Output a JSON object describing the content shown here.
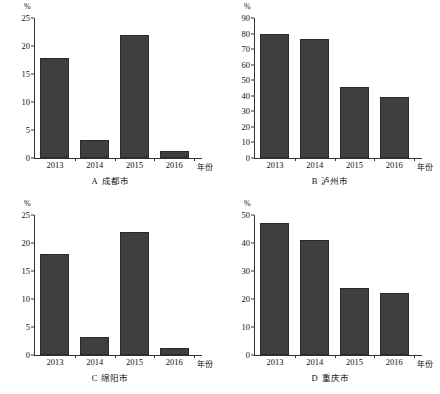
{
  "figure": {
    "y_unit": "%",
    "x_axis_name": "年份",
    "categories": [
      "2013",
      "2014",
      "2015",
      "2016"
    ],
    "bar_color": "#3f3f3f"
  },
  "panels": [
    {
      "letter": "A",
      "city": "成都市",
      "caption": "A 成都市",
      "y_unit": "%",
      "x_axis_name": "年份",
      "yticks": [
        "0",
        "5",
        "10",
        "15",
        "20",
        "25"
      ],
      "ymax": 25,
      "values": [
        17.8,
        3.2,
        22.0,
        1.3
      ],
      "categories": [
        "2013",
        "2014",
        "2015",
        "2016"
      ]
    },
    {
      "letter": "B",
      "city": "泸州市",
      "caption": "B 泸州市",
      "y_unit": "%",
      "x_axis_name": "年份",
      "yticks": [
        "0",
        "10",
        "20",
        "30",
        "40",
        "50",
        "60",
        "70",
        "80",
        "90"
      ],
      "ymax": 90,
      "values": [
        80.0,
        76.5,
        45.5,
        39.0
      ],
      "categories": [
        "2013",
        "2014",
        "2015",
        "2016"
      ]
    },
    {
      "letter": "C",
      "city": "绵阳市",
      "caption": "C 绵阳市",
      "y_unit": "%",
      "x_axis_name": "年份",
      "yticks": [
        "0",
        "5",
        "10",
        "15",
        "20",
        "25"
      ],
      "ymax": 25,
      "values": [
        18.0,
        3.2,
        22.0,
        1.3
      ],
      "categories": [
        "2013",
        "2014",
        "2015",
        "2016"
      ]
    },
    {
      "letter": "D",
      "city": "重庆市",
      "caption": "D 重庆市",
      "y_unit": "%",
      "x_axis_name": "年份",
      "yticks": [
        "0",
        "10",
        "20",
        "30",
        "40",
        "50"
      ],
      "ymax": 50,
      "values": [
        47.0,
        41.0,
        24.0,
        22.0
      ],
      "categories": [
        "2013",
        "2014",
        "2015",
        "2016"
      ]
    }
  ],
  "chart_data": [
    {
      "type": "bar",
      "title": "A 成都市",
      "categories": [
        "2013",
        "2014",
        "2015",
        "2016"
      ],
      "values": [
        17.8,
        3.2,
        22.0,
        1.3
      ],
      "xlabel": "年份",
      "ylabel": "%",
      "ylim": [
        0,
        25
      ],
      "ytick_step": 5,
      "grid": false,
      "legend": "none"
    },
    {
      "type": "bar",
      "title": "B 泸州市",
      "categories": [
        "2013",
        "2014",
        "2015",
        "2016"
      ],
      "values": [
        80.0,
        76.5,
        45.5,
        39.0
      ],
      "xlabel": "年份",
      "ylabel": "%",
      "ylim": [
        0,
        90
      ],
      "ytick_step": 10,
      "grid": false,
      "legend": "none"
    },
    {
      "type": "bar",
      "title": "C 绵阳市",
      "categories": [
        "2013",
        "2014",
        "2015",
        "2016"
      ],
      "values": [
        18.0,
        3.2,
        22.0,
        1.3
      ],
      "xlabel": "年份",
      "ylabel": "%",
      "ylim": [
        0,
        25
      ],
      "ytick_step": 5,
      "grid": false,
      "legend": "none"
    },
    {
      "type": "bar",
      "title": "D 重庆市",
      "categories": [
        "2013",
        "2014",
        "2015",
        "2016"
      ],
      "values": [
        47.0,
        41.0,
        24.0,
        22.0
      ],
      "xlabel": "年份",
      "ylabel": "%",
      "ylim": [
        0,
        50
      ],
      "ytick_step": 10,
      "grid": false,
      "legend": "none"
    }
  ]
}
